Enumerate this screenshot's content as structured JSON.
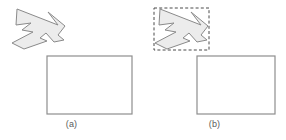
{
  "figure": {
    "background_color": "#ffffff",
    "width": 286,
    "height": 140,
    "colors": {
      "polygon_fill": "#ececec",
      "polygon_stroke": "#8a8a8a",
      "rectangle_stroke": "#8e8e8e",
      "bbox_stroke": "#4a4a4a",
      "caption_text": "#5b5b5b"
    }
  },
  "panels": [
    {
      "id": "a",
      "caption": "(a)",
      "has_bounding_box": false,
      "shape": {
        "name": "arrow-polygon",
        "fill": "#ececec",
        "stroke": "#8a8a8a",
        "points": "17,9 58,25 48,12 65,26 58,35 64,40 54,42 46,33 40,38 47,41 24,49 12,43 33,32 22,30 31,23 16,25"
      },
      "rectangle": {
        "name": "empty-rectangle",
        "x": 47,
        "y": 56,
        "width": 85,
        "height": 58,
        "stroke": "#8e8e8e",
        "fill": "#ffffff"
      }
    },
    {
      "id": "b",
      "caption": "(b)",
      "has_bounding_box": true,
      "shape": {
        "name": "arrow-polygon",
        "fill": "#ececec",
        "stroke": "#8a8a8a",
        "points": "17,9 58,25 48,12 65,26 58,35 64,40 54,42 46,33 40,38 47,41 24,49 12,43 33,32 22,30 31,23 16,25"
      },
      "bounding_box": {
        "name": "dashed-bounding-box",
        "x": 11,
        "y": 8,
        "width": 55,
        "height": 42,
        "stroke": "#4a4a4a",
        "dash_pattern": "3 2.2"
      },
      "rectangle": {
        "name": "empty-rectangle",
        "x": 54,
        "y": 56,
        "width": 78,
        "height": 58,
        "stroke": "#8e8e8e",
        "fill": "#ffffff"
      }
    }
  ]
}
